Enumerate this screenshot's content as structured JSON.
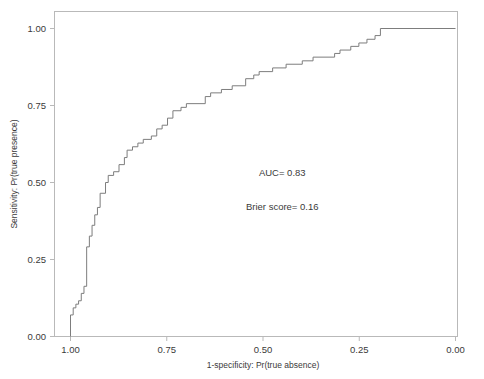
{
  "chart_data": {
    "type": "line",
    "title": "",
    "xlabel": "1-specificity: Pr(true absence)",
    "ylabel": "Sensitivity: Pr(true presence)",
    "xticks": [
      "1.00",
      "0.75",
      "0.50",
      "0.25",
      "0.00"
    ],
    "xtick_values": [
      1.0,
      0.75,
      0.5,
      0.25,
      0.0
    ],
    "yticks": [
      "0.00",
      "0.25",
      "0.50",
      "0.75",
      "1.00"
    ],
    "ytick_values": [
      0.0,
      0.25,
      0.5,
      0.75,
      1.0
    ],
    "xlim": [
      1.0,
      0.0
    ],
    "ylim": [
      0.0,
      1.0
    ],
    "x_axis_reversed": true,
    "grid": false,
    "legend": "none",
    "line_color": "#7d7d7d",
    "frame_color": "#b9b9b9",
    "annotations": [
      {
        "text": "AUC= 0.83",
        "x": 0.45,
        "y": 0.52
      },
      {
        "text": "Brier score= 0.16",
        "x": 0.45,
        "y": 0.41
      }
    ],
    "series": [
      {
        "name": "ROC curve",
        "style": "step",
        "points": [
          [
            1.0,
            0.0
          ],
          [
            1.0,
            0.07
          ],
          [
            0.993,
            0.07
          ],
          [
            0.993,
            0.093
          ],
          [
            0.986,
            0.093
          ],
          [
            0.986,
            0.105
          ],
          [
            0.979,
            0.105
          ],
          [
            0.979,
            0.116
          ],
          [
            0.972,
            0.116
          ],
          [
            0.972,
            0.14
          ],
          [
            0.965,
            0.14
          ],
          [
            0.965,
            0.163
          ],
          [
            0.958,
            0.163
          ],
          [
            0.958,
            0.291
          ],
          [
            0.951,
            0.291
          ],
          [
            0.951,
            0.326
          ],
          [
            0.944,
            0.326
          ],
          [
            0.944,
            0.361
          ],
          [
            0.937,
            0.361
          ],
          [
            0.937,
            0.395
          ],
          [
            0.93,
            0.395
          ],
          [
            0.93,
            0.419
          ],
          [
            0.923,
            0.419
          ],
          [
            0.923,
            0.465
          ],
          [
            0.909,
            0.465
          ],
          [
            0.909,
            0.5
          ],
          [
            0.902,
            0.5
          ],
          [
            0.902,
            0.523
          ],
          [
            0.888,
            0.523
          ],
          [
            0.888,
            0.535
          ],
          [
            0.874,
            0.535
          ],
          [
            0.874,
            0.558
          ],
          [
            0.86,
            0.558
          ],
          [
            0.86,
            0.581
          ],
          [
            0.853,
            0.581
          ],
          [
            0.853,
            0.605
          ],
          [
            0.839,
            0.605
          ],
          [
            0.839,
            0.616
          ],
          [
            0.825,
            0.616
          ],
          [
            0.825,
            0.628
          ],
          [
            0.811,
            0.628
          ],
          [
            0.811,
            0.64
          ],
          [
            0.79,
            0.64
          ],
          [
            0.79,
            0.651
          ],
          [
            0.776,
            0.651
          ],
          [
            0.776,
            0.674
          ],
          [
            0.762,
            0.674
          ],
          [
            0.762,
            0.686
          ],
          [
            0.748,
            0.686
          ],
          [
            0.748,
            0.709
          ],
          [
            0.734,
            0.709
          ],
          [
            0.734,
            0.733
          ],
          [
            0.713,
            0.733
          ],
          [
            0.713,
            0.744
          ],
          [
            0.699,
            0.744
          ],
          [
            0.699,
            0.756
          ],
          [
            0.65,
            0.756
          ],
          [
            0.65,
            0.779
          ],
          [
            0.636,
            0.779
          ],
          [
            0.636,
            0.791
          ],
          [
            0.608,
            0.791
          ],
          [
            0.608,
            0.802
          ],
          [
            0.58,
            0.802
          ],
          [
            0.58,
            0.814
          ],
          [
            0.545,
            0.814
          ],
          [
            0.545,
            0.837
          ],
          [
            0.524,
            0.837
          ],
          [
            0.524,
            0.849
          ],
          [
            0.51,
            0.849
          ],
          [
            0.51,
            0.86
          ],
          [
            0.475,
            0.86
          ],
          [
            0.475,
            0.872
          ],
          [
            0.44,
            0.872
          ],
          [
            0.44,
            0.884
          ],
          [
            0.398,
            0.884
          ],
          [
            0.398,
            0.895
          ],
          [
            0.37,
            0.895
          ],
          [
            0.37,
            0.907
          ],
          [
            0.314,
            0.907
          ],
          [
            0.314,
            0.919
          ],
          [
            0.3,
            0.919
          ],
          [
            0.3,
            0.93
          ],
          [
            0.272,
            0.93
          ],
          [
            0.272,
            0.942
          ],
          [
            0.251,
            0.942
          ],
          [
            0.251,
            0.953
          ],
          [
            0.23,
            0.953
          ],
          [
            0.23,
            0.965
          ],
          [
            0.209,
            0.965
          ],
          [
            0.209,
            0.977
          ],
          [
            0.195,
            0.977
          ],
          [
            0.195,
            1.0
          ],
          [
            0.0,
            1.0
          ]
        ]
      }
    ]
  }
}
